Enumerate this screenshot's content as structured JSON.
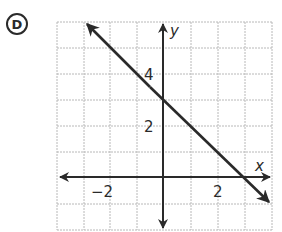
{
  "choice_label": "D",
  "graph": {
    "x_axis_label": "x",
    "y_axis_label": "y",
    "tick_labels": {
      "x_neg2": "−2",
      "x_2": "2",
      "y_2": "2",
      "y_4": "4"
    },
    "grid": {
      "x_range": [
        -4,
        4
      ],
      "y_range": [
        -2,
        6
      ],
      "unit": 1
    },
    "line": {
      "equation": "y = -x + 3",
      "slope": -1,
      "y_intercept": 3,
      "x_intercept": 3,
      "from": [
        -3,
        6
      ],
      "to": [
        4,
        -1
      ]
    },
    "colors": {
      "grid": "#b8b8b8",
      "ink": "#2a2a2a"
    }
  }
}
